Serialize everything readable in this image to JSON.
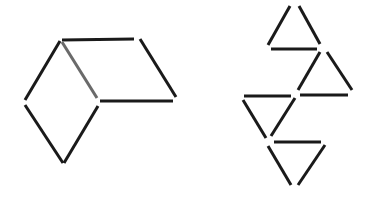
{
  "figure": {
    "colors": {
      "background": "#ffffff",
      "stick": "#1a1a1a",
      "highlighted_stick": "#6a6a6a"
    },
    "stroke_width": 3,
    "left_figure": {
      "name": "rhombus-pair",
      "sticks": [
        {
          "id": "top-horizontal",
          "x1": 62,
          "y1": 40,
          "x2": 134,
          "y2": 39,
          "color": "#1a1a1a"
        },
        {
          "id": "right-slant",
          "x1": 140,
          "y1": 39,
          "x2": 176,
          "y2": 97,
          "color": "#1a1a1a"
        },
        {
          "id": "middle-horizontal",
          "x1": 100,
          "y1": 101,
          "x2": 173,
          "y2": 101,
          "color": "#1a1a1a"
        },
        {
          "id": "inner-diagonal",
          "x1": 62,
          "y1": 42,
          "x2": 97,
          "y2": 98,
          "color": "#6a6a6a"
        },
        {
          "id": "left-upper",
          "x1": 60,
          "y1": 41,
          "x2": 25,
          "y2": 100,
          "color": "#1a1a1a"
        },
        {
          "id": "left-lower",
          "x1": 25,
          "y1": 105,
          "x2": 63,
          "y2": 163,
          "color": "#1a1a1a"
        },
        {
          "id": "bottom-right",
          "x1": 64,
          "y1": 163,
          "x2": 98,
          "y2": 106,
          "color": "#1a1a1a"
        }
      ]
    },
    "right_figure": {
      "name": "four-triangles",
      "sticks": [
        {
          "id": "t1-left",
          "x1": 268,
          "y1": 45,
          "x2": 290,
          "y2": 6,
          "color": "#1a1a1a"
        },
        {
          "id": "t1-right",
          "x1": 299,
          "y1": 6,
          "x2": 320,
          "y2": 44,
          "color": "#1a1a1a"
        },
        {
          "id": "t1-base",
          "x1": 271,
          "y1": 49,
          "x2": 317,
          "y2": 49,
          "color": "#1a1a1a"
        },
        {
          "id": "t2-left",
          "x1": 298,
          "y1": 90,
          "x2": 320,
          "y2": 52,
          "color": "#1a1a1a"
        },
        {
          "id": "t2-right",
          "x1": 327,
          "y1": 52,
          "x2": 352,
          "y2": 90,
          "color": "#1a1a1a"
        },
        {
          "id": "t2-base",
          "x1": 300,
          "y1": 95,
          "x2": 348,
          "y2": 95,
          "color": "#1a1a1a"
        },
        {
          "id": "t3-top",
          "x1": 244,
          "y1": 96,
          "x2": 291,
          "y2": 96,
          "color": "#1a1a1a"
        },
        {
          "id": "t3-left",
          "x1": 243,
          "y1": 100,
          "x2": 266,
          "y2": 138,
          "color": "#1a1a1a"
        },
        {
          "id": "t3-right",
          "x1": 271,
          "y1": 136,
          "x2": 295,
          "y2": 98,
          "color": "#1a1a1a"
        },
        {
          "id": "t4-top",
          "x1": 274,
          "y1": 142,
          "x2": 321,
          "y2": 142,
          "color": "#1a1a1a"
        },
        {
          "id": "t4-left",
          "x1": 268,
          "y1": 146,
          "x2": 291,
          "y2": 185,
          "color": "#1a1a1a"
        },
        {
          "id": "t4-right",
          "x1": 298,
          "y1": 185,
          "x2": 325,
          "y2": 145,
          "color": "#1a1a1a"
        }
      ]
    }
  }
}
